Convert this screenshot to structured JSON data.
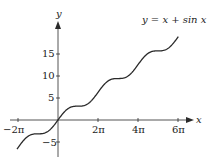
{
  "chart_data": {
    "type": "line",
    "title": "y = x + sin x",
    "xlabel": "x",
    "ylabel": "y",
    "x_ticks": [
      "−2π",
      "2π",
      "4π",
      "6π"
    ],
    "y_ticks": [
      "15",
      "10",
      "5",
      "−5"
    ],
    "xlim": [
      -6.45,
      19.5
    ],
    "ylim": [
      -8.5,
      22
    ],
    "series": [
      {
        "name": "y = x + sin x",
        "function": "x + sin(x)",
        "x_range": [
          -6.44,
          18.9
        ]
      }
    ],
    "colors": {
      "curve": "#2a2a2a",
      "axes": "#2a2a2a"
    }
  },
  "labels": {
    "formula": "y = x + sin x",
    "x_axis": "x",
    "y_axis": "y",
    "tick_neg2pi": "−2π",
    "tick_2pi": "2π",
    "tick_4pi": "4π",
    "tick_6pi": "6π",
    "tick_15": "15",
    "tick_10": "10",
    "tick_5": "5",
    "tick_neg5": "−5"
  }
}
